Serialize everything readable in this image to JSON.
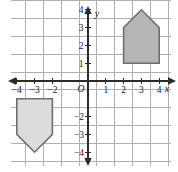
{
  "figure": {
    "background_color": "#ffffff"
  },
  "colors": {
    "grid": "#b0b0b0",
    "axis": "#2b2b2b",
    "label": "#1a1a1a",
    "shape_a_fill": "#b5b5b5",
    "shape_a_stroke": "#6e6e6e",
    "shape_b_fill": "#dcdcdc",
    "shape_b_stroke": "#6e6e6e"
  },
  "axes": {
    "x_axis_name": "x",
    "y_axis_name": "y",
    "origin_label": "O",
    "x_range": [
      -4.6,
      4.6
    ],
    "y_range": [
      -4.6,
      4.6
    ],
    "grid": true,
    "x_tick_labels": [
      "-4",
      "-3",
      "-2",
      "1",
      "2",
      "3",
      "4"
    ],
    "x_tick_values": [
      -4,
      -3,
      -2,
      1,
      2,
      3,
      4
    ],
    "y_tick_labels": [
      "4",
      "3",
      "2",
      "1",
      "-2",
      "-3",
      "-4"
    ],
    "y_tick_values": [
      4,
      3,
      2,
      1,
      -2,
      -3,
      -4
    ]
  },
  "chart_data": {
    "type": "scatter",
    "xlabel": "x",
    "ylabel": "y",
    "xlim": [
      -4.6,
      4.6
    ],
    "ylim": [
      -4.6,
      4.6
    ],
    "grid": true,
    "legend": "none",
    "shapes": [
      {
        "name": "pentagon-upper-right",
        "description": "House-shaped pentagon in quadrant I, apex pointing up",
        "fill": "#b5b5b5",
        "stroke": "#6e6e6e",
        "vertices": [
          [
            2,
            1
          ],
          [
            4,
            1
          ],
          [
            4,
            3
          ],
          [
            3,
            4
          ],
          [
            2,
            3
          ]
        ]
      },
      {
        "name": "pentagon-lower-left",
        "description": "Inverted house-shaped pentagon in quadrant III, apex pointing down",
        "fill": "#dcdcdc",
        "stroke": "#6e6e6e",
        "vertices": [
          [
            -4,
            -1
          ],
          [
            -2,
            -1
          ],
          [
            -2,
            -3
          ],
          [
            -3,
            -4
          ],
          [
            -4,
            -3
          ]
        ]
      }
    ]
  }
}
